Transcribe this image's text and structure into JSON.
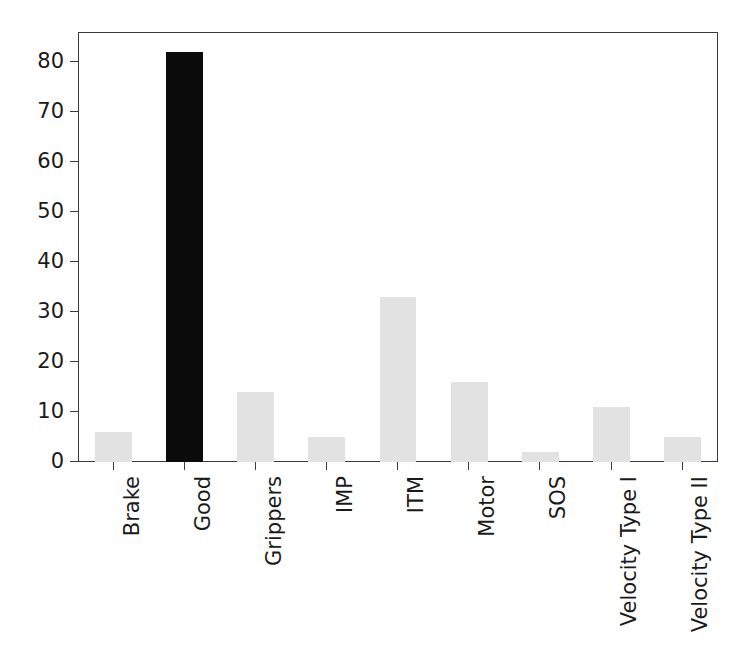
{
  "chart_data": {
    "type": "bar",
    "title": "",
    "subtitle": "",
    "xlabel": "",
    "ylabel": "",
    "categories": [
      "Brake",
      "Good",
      "Grippers",
      "IMP",
      "ITM",
      "Motor",
      "SOS",
      "Velocity Type I",
      "Velocity Type II"
    ],
    "values": [
      6,
      82,
      14,
      5,
      33,
      16,
      2,
      11,
      5
    ],
    "highlight_index": 1,
    "ylim": [
      0,
      86
    ],
    "yticks": [
      0,
      10,
      20,
      30,
      40,
      50,
      60,
      70,
      80
    ],
    "ytick_labels": [
      "0",
      "10",
      "20",
      "30",
      "40",
      "50",
      "60",
      "70",
      "80"
    ],
    "grid": false,
    "legend": null,
    "legend_position": "none",
    "bar_color": "#e2e2e2",
    "highlight_color": "#0b0b0b",
    "axis_color": "#3a3a3a",
    "background_color": "#ffffff",
    "xtick_label_rotation": 90
  }
}
